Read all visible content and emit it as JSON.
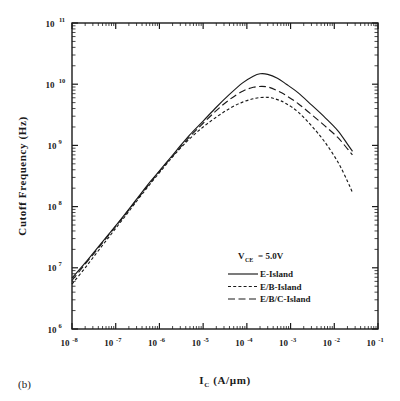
{
  "figure": {
    "panel_label": "(b)",
    "background": "#ffffff",
    "ink_color": "#1a1a1a"
  },
  "chart_data": {
    "type": "line",
    "title": "",
    "subtitle": "",
    "xlabel": "I_C  (A/µm)",
    "xlabel_parts": {
      "symbol": "I",
      "subscript": "C",
      "units": "(A/µm)"
    },
    "ylabel": "Cutoff Frequency (Hz)",
    "xscale": "log",
    "yscale": "log",
    "xlim": [
      1e-08,
      0.1
    ],
    "ylim": [
      1000000.0,
      100000000000.0
    ],
    "grid": false,
    "minor_ticks": true,
    "legend_position": "lower-right-inside",
    "annotations": [
      {
        "text": "V_CE = 5.0V",
        "symbol": "V",
        "subscript": "CE",
        "value": "= 5.0V",
        "x": 0.0012,
        "y": 30000000.0
      }
    ],
    "xticks": [
      {
        "value": 1e-08,
        "label": "10",
        "exp": "-8"
      },
      {
        "value": 1e-07,
        "label": "10",
        "exp": "-7"
      },
      {
        "value": 1e-06,
        "label": "10",
        "exp": "-6"
      },
      {
        "value": 1e-05,
        "label": "10",
        "exp": "-5"
      },
      {
        "value": 0.0001,
        "label": "10",
        "exp": "-4"
      },
      {
        "value": 0.001,
        "label": "10",
        "exp": "-3"
      },
      {
        "value": 0.01,
        "label": "10",
        "exp": "-2"
      },
      {
        "value": 0.1,
        "label": "10",
        "exp": "-1"
      }
    ],
    "yticks": [
      {
        "value": 1000000.0,
        "label": "10",
        "exp": "6"
      },
      {
        "value": 10000000.0,
        "label": "10",
        "exp": "7"
      },
      {
        "value": 100000000.0,
        "label": "10",
        "exp": "8"
      },
      {
        "value": 1000000000.0,
        "label": "10",
        "exp": "9"
      },
      {
        "value": 10000000000.0,
        "label": "10",
        "exp": "10"
      },
      {
        "value": 100000000000.0,
        "label": "10",
        "exp": "11"
      }
    ],
    "series": [
      {
        "name": "E-Island",
        "style": "solid",
        "dasharray": "",
        "x": [
          1e-08,
          2e-08,
          4e-08,
          8e-08,
          1.6e-07,
          3.2e-07,
          6.3e-07,
          1.3e-06,
          2.5e-06,
          5e-06,
          1e-05,
          2e-05,
          4e-05,
          8e-05,
          0.00014,
          0.0002,
          0.0003,
          0.0005,
          0.0008,
          0.0015,
          0.003,
          0.006,
          0.012,
          0.02,
          0.026
        ],
        "y": [
          6800000.0,
          12000000.0,
          22000000.0,
          40000000.0,
          74000000.0,
          140000000.0,
          260000000.0,
          480000000.0,
          840000000.0,
          1500000000.0,
          2500000000.0,
          4200000000.0,
          6800000000.0,
          10500000000.0,
          13500000000.0,
          14800000000.0,
          14500000000.0,
          12500000000.0,
          10000000000.0,
          7200000000.0,
          4600000000.0,
          2900000000.0,
          1750000000.0,
          1050000000.0,
          800000000.0
        ]
      },
      {
        "name": "E/B-Island",
        "style": "dotted",
        "dasharray": "3,2.2",
        "x": [
          1e-08,
          2e-08,
          4e-08,
          8e-08,
          1.6e-07,
          3.2e-07,
          6.3e-07,
          1.3e-06,
          2.5e-06,
          5e-06,
          1e-05,
          2e-05,
          4e-05,
          8e-05,
          0.00016,
          0.0003,
          0.0005,
          0.0008,
          0.0015,
          0.003,
          0.006,
          0.012,
          0.02,
          0.026
        ],
        "y": [
          5400000.0,
          10000000.0,
          19000000.0,
          36000000.0,
          68000000.0,
          130000000.0,
          240000000.0,
          450000000.0,
          780000000.0,
          1300000000.0,
          2000000000.0,
          2900000000.0,
          4000000000.0,
          5100000000.0,
          5900000000.0,
          6100000000.0,
          5600000000.0,
          4800000000.0,
          3500000000.0,
          2100000000.0,
          1150000000.0,
          540000000.0,
          260000000.0,
          170000000.0
        ]
      },
      {
        "name": "E/B/C-Island",
        "style": "dashed",
        "dasharray": "7,3.5",
        "x": [
          1e-08,
          2e-08,
          4e-08,
          8e-08,
          1.6e-07,
          3.2e-07,
          6.3e-07,
          1.3e-06,
          2.5e-06,
          5e-06,
          1e-05,
          2e-05,
          4e-05,
          8e-05,
          0.00014,
          0.00022,
          0.00032,
          0.0005,
          0.0008,
          0.0015,
          0.003,
          0.006,
          0.012,
          0.02,
          0.026
        ],
        "y": [
          6200000.0,
          11500000.0,
          21000000.0,
          39000000.0,
          72000000.0,
          135000000.0,
          250000000.0,
          470000000.0,
          800000000.0,
          1400000000.0,
          2300000000.0,
          3700000000.0,
          5600000000.0,
          7700000000.0,
          8900000000.0,
          9200000000.0,
          8900000000.0,
          7800000000.0,
          6500000000.0,
          4800000000.0,
          3200000000.0,
          2100000000.0,
          1350000000.0,
          880000000.0,
          700000000.0
        ]
      }
    ],
    "legend": [
      {
        "label": "E-Island",
        "style": "solid"
      },
      {
        "label": "E/B-Island",
        "style": "dotted"
      },
      {
        "label": "E/B/C-Island",
        "style": "dashed"
      }
    ]
  }
}
